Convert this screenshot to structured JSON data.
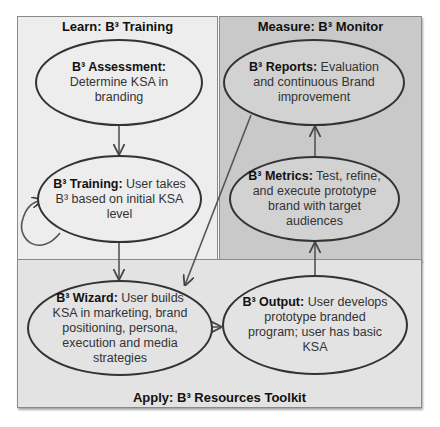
{
  "panels": {
    "learn": {
      "title": "Learn: B³ Training",
      "fill": "#ededed"
    },
    "measure": {
      "title": "Measure: B³ Monitor",
      "fill": "#c9c9c9"
    },
    "apply": {
      "title": "Apply: B³ Resources Toolkit",
      "fill": "#e3e3e3"
    }
  },
  "nodes": {
    "assessment": {
      "label": "B³ Assessment:",
      "text": "Determine KSA in branding"
    },
    "training": {
      "label": "B³ Training:",
      "text": "User takes B³ based on initial KSA level"
    },
    "wizard": {
      "label": "B³ Wizard:",
      "text": "User builds KSA in marketing, brand positioning, persona, execution and media strategies"
    },
    "output": {
      "label": "B³ Output:",
      "text": "User develops prototype branded program; user has basic KSA"
    },
    "metrics": {
      "label": "B³ Metrics:",
      "text": "Test, refine, and execute prototype brand with target audiences"
    },
    "reports": {
      "label": "B³ Reports:",
      "text": "Evaluation and continuous Brand improvement"
    }
  },
  "edges": [
    {
      "from": "assessment",
      "to": "training"
    },
    {
      "from": "training",
      "to": "training",
      "type": "self-loop"
    },
    {
      "from": "training",
      "to": "wizard"
    },
    {
      "from": "wizard",
      "to": "output"
    },
    {
      "from": "output",
      "to": "metrics"
    },
    {
      "from": "metrics",
      "to": "reports"
    },
    {
      "from": "reports",
      "to": "wizard"
    }
  ],
  "colors": {
    "stroke": "#333333",
    "panel_border": "#8a8a8a"
  }
}
